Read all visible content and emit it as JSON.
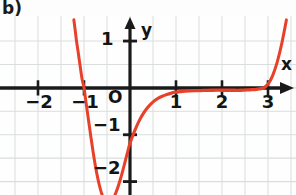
{
  "figure": {
    "panel_label": "b)",
    "background_color": "#fefefe",
    "grid_color": "#d9dddd",
    "axis_color": "#1a1a1a",
    "curve_color": "#e8412a"
  },
  "axes": {
    "x_axis_name": "x",
    "y_axis_name": "y",
    "origin_label": "O",
    "x_ticks": [
      {
        "value": -2,
        "label": "−2"
      },
      {
        "value": -1,
        "label": "−1"
      },
      {
        "value": 1,
        "label": "1"
      },
      {
        "value": 2,
        "label": "2"
      },
      {
        "value": 3,
        "label": "3"
      }
    ],
    "y_ticks": [
      {
        "value": 1,
        "label": "1"
      },
      {
        "value": -1,
        "label": "−1"
      },
      {
        "value": -2,
        "label": "−2"
      }
    ]
  },
  "chart_data": {
    "type": "line",
    "title": "",
    "xlabel": "x",
    "ylabel": "y",
    "xlim": [
      -2.85,
      3.6
    ],
    "ylim": [
      -2.65,
      1.45
    ],
    "grid": true,
    "grid_step": 0.5,
    "legend": "none",
    "series": [
      {
        "name": "curve",
        "color": "#e8412a",
        "x": [
          -1.22,
          -1.19,
          -1.16,
          -1.12,
          -1.08,
          -1.04,
          -1.0,
          -0.95,
          -0.9,
          -0.85,
          -0.8,
          -0.75,
          -0.7,
          -0.65,
          -0.6,
          -0.55,
          -0.5,
          -0.45,
          -0.4,
          -0.35,
          -0.3,
          -0.25,
          -0.2,
          -0.15,
          -0.1,
          -0.05,
          0.0,
          0.1,
          0.2,
          0.3,
          0.4,
          0.5,
          0.6,
          0.7,
          0.8,
          0.9,
          1.0,
          1.2,
          1.4,
          1.6,
          1.8,
          2.0,
          2.2,
          2.4,
          2.6,
          2.75,
          2.9,
          3.0,
          3.1,
          3.2,
          3.3,
          3.4
        ],
        "y": [
          1.45,
          1.22,
          0.98,
          0.72,
          0.44,
          0.18,
          0.0,
          -0.35,
          -0.7,
          -1.05,
          -1.38,
          -1.68,
          -1.93,
          -2.14,
          -2.3,
          -2.4,
          -2.45,
          -2.45,
          -2.42,
          -2.34,
          -2.22,
          -2.08,
          -1.92,
          -1.74,
          -1.55,
          -1.36,
          -1.18,
          -0.92,
          -0.7,
          -0.53,
          -0.4,
          -0.3,
          -0.23,
          -0.18,
          -0.14,
          -0.11,
          -0.09,
          -0.07,
          -0.06,
          -0.055,
          -0.05,
          -0.05,
          -0.05,
          -0.05,
          -0.04,
          -0.03,
          0.0,
          0.08,
          0.26,
          0.55,
          0.95,
          1.45
        ]
      }
    ],
    "annotations": [
      {
        "text": "root",
        "x": -1.0,
        "y": 0.0
      },
      {
        "text": "minimum",
        "x": -0.47,
        "y": -2.45
      },
      {
        "text": "flat-region",
        "x": 2.0,
        "y": -0.05
      },
      {
        "text": "steep-rise",
        "x": 3.2,
        "y": 0.55
      }
    ]
  }
}
